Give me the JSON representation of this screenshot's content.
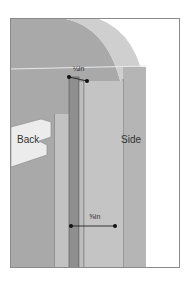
{
  "diagram": {
    "labels": {
      "back": "Back",
      "side": "Side"
    },
    "dimensions": {
      "top": "¼in",
      "bottom": "⅝in"
    },
    "colors": {
      "back_panel": "#a9a9a9",
      "side_band": "#cfcfcf",
      "strip_dark": "#8f8f8f",
      "strip_light": "#bdbdbd",
      "frame_border": "#8a8a8a"
    }
  }
}
